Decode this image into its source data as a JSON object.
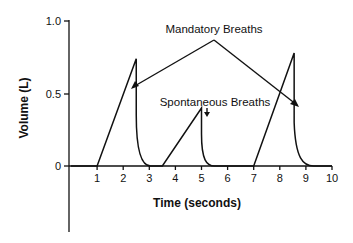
{
  "chart_data": {
    "type": "line",
    "title": "",
    "xlabel": "Time (seconds)",
    "ylabel": "Volume (L)",
    "xlim": [
      0,
      10
    ],
    "ylim": [
      -0.45,
      1.0
    ],
    "x_ticks": [
      "1",
      "2",
      "3",
      "4",
      "5",
      "6",
      "7",
      "8",
      "9",
      "10"
    ],
    "y_ticks": [
      "0",
      "0.5",
      "1.0"
    ],
    "grid": false,
    "legend": null,
    "series": [
      {
        "name": "Volume",
        "points": [
          [
            0,
            0
          ],
          [
            1,
            0
          ],
          [
            2.5,
            0.74
          ],
          [
            2.5,
            0.35
          ],
          [
            2.6,
            0.18
          ],
          [
            2.8,
            0.07
          ],
          [
            3.05,
            0.0
          ],
          [
            3.5,
            0
          ],
          [
            5.0,
            0.4
          ],
          [
            5.0,
            0.2
          ],
          [
            5.15,
            0.06
          ],
          [
            5.5,
            0.0
          ],
          [
            7.0,
            0
          ],
          [
            8.55,
            0.78
          ],
          [
            8.55,
            0.35
          ],
          [
            8.7,
            0.15
          ],
          [
            9.0,
            0.03
          ],
          [
            9.3,
            0
          ],
          [
            10,
            0
          ]
        ]
      }
    ],
    "annotations": [
      {
        "text": "Mandatory Breaths",
        "points_to": [
          [
            2.4,
            0.5
          ],
          [
            8.7,
            0.48
          ]
        ]
      },
      {
        "text": "Spontaneous Breaths",
        "points_to": [
          [
            5.2,
            0.38
          ]
        ]
      }
    ]
  },
  "labels": {
    "xlabel": "Time (seconds)",
    "ylabel": "Volume (L)",
    "mandatory": "Mandatory Breaths",
    "spontaneous": "Spontaneous Breaths",
    "x_ticks": [
      "1",
      "2",
      "3",
      "4",
      "5",
      "6",
      "7",
      "8",
      "9",
      "10"
    ],
    "y_ticks": [
      "0",
      "0.5",
      "1.0"
    ]
  }
}
